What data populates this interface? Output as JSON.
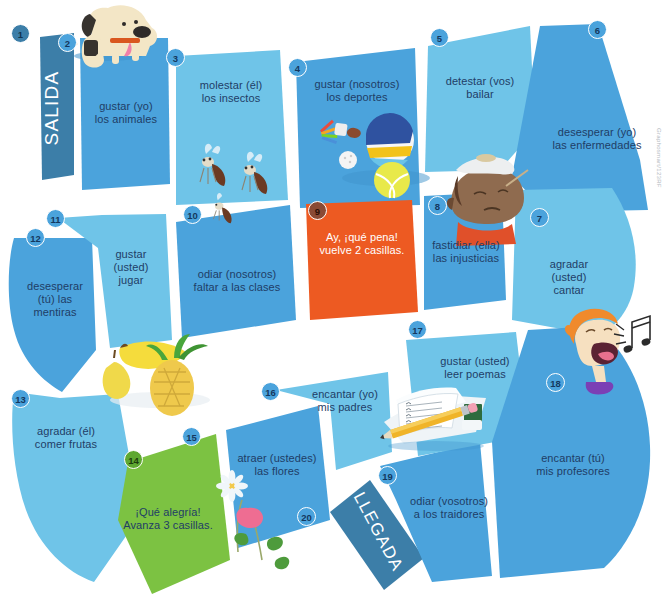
{
  "board": {
    "title_start": "SALIDA",
    "title_end": "LLEGADA",
    "watermark": "Graphosmart/123RF",
    "colors": {
      "tile_light": "#6FC4E8",
      "tile_medium": "#4BA3DC",
      "tile_dark_banner": "#3C7EA8",
      "tile_penalty_orange": "#ED5A22",
      "tile_bonus_green": "#7CC242",
      "text_navy": "#1F3D66",
      "background": "#FFFFFF"
    }
  },
  "squares": [
    {
      "number": "1",
      "text": "SALIDA",
      "kind": "start"
    },
    {
      "number": "2",
      "text": "gustar (yo)\nlos animales",
      "kind": "normal"
    },
    {
      "number": "3",
      "text": "molestar (él)\nlos insectos",
      "kind": "normal"
    },
    {
      "number": "4",
      "text": "gustar (nosotros)\nlos deportes",
      "kind": "normal"
    },
    {
      "number": "5",
      "text": "detestar (vos)\nbailar",
      "kind": "normal"
    },
    {
      "number": "6",
      "text": "desesperar (yo)\nlas enfermedades",
      "kind": "normal"
    },
    {
      "number": "7",
      "text": "agradar\n(usted)\ncantar",
      "kind": "normal"
    },
    {
      "number": "8",
      "text": "fastidiar (ella)\nlas injusticias",
      "kind": "normal"
    },
    {
      "number": "9",
      "text": "Ay, ¡qué pena!\nvuelve 2 casillas.",
      "kind": "penalty"
    },
    {
      "number": "10",
      "text": "odiar (nosotros)\nfaltar a las clases",
      "kind": "normal"
    },
    {
      "number": "11",
      "text": "gustar\n(usted)\njugar",
      "kind": "normal"
    },
    {
      "number": "12",
      "text": "desesperar\n(tú) las\nmentiras",
      "kind": "normal"
    },
    {
      "number": "13",
      "text": "agradar (él)\ncomer frutas",
      "kind": "normal"
    },
    {
      "number": "14",
      "text": "¡Qué alegría!\nAvanza 3 casillas.",
      "kind": "bonus"
    },
    {
      "number": "15",
      "text": "atraer (ustedes)\nlas flores",
      "kind": "normal"
    },
    {
      "number": "16",
      "text": "encantar (yo)\nmis padres",
      "kind": "normal"
    },
    {
      "number": "17",
      "text": "gustar (usted)\nleer poemas",
      "kind": "normal"
    },
    {
      "number": "18",
      "text": "encantar (tú)\nmis profesores",
      "kind": "normal"
    },
    {
      "number": "19",
      "text": "odiar (vosotros)\na los traidores",
      "kind": "normal"
    },
    {
      "number": "20",
      "text": "LLEGADA",
      "kind": "finish"
    }
  ],
  "illustrations": [
    {
      "name": "dog-illustration",
      "subject": "dog"
    },
    {
      "name": "mosquitoes-illustration",
      "subject": "insects"
    },
    {
      "name": "sports-balls-illustration",
      "subject": "sports balls and shuttlecock"
    },
    {
      "name": "sick-person-illustration",
      "subject": "person with ice pack and thermometer"
    },
    {
      "name": "fruits-illustration",
      "subject": "banana, pear and pineapple"
    },
    {
      "name": "flowers-illustration",
      "subject": "daisy and pink flower"
    },
    {
      "name": "notebook-illustration",
      "subject": "notebook, pencil and eraser"
    },
    {
      "name": "singing-boy-illustration",
      "subject": "boy singing with music notes"
    }
  ]
}
